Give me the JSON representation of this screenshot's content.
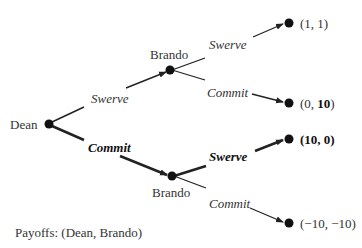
{
  "tree": {
    "root": {
      "label": "Dean"
    },
    "players": [
      "Dean",
      "Brando"
    ],
    "nodes": {
      "dean": {
        "label": "Dean"
      },
      "brando_top": {
        "label": "Brando"
      },
      "brando_bottom": {
        "label": "Brando"
      }
    },
    "edges": {
      "dean_swerve": {
        "label": "Swerve",
        "emphasis": false
      },
      "dean_commit": {
        "label": "Commit",
        "emphasis": true
      },
      "top_swerve": {
        "label": "Swerve",
        "emphasis": false
      },
      "top_commit": {
        "label": "Commit",
        "emphasis": false
      },
      "bottom_swerve": {
        "label": "Swerve",
        "emphasis": true
      },
      "bottom_commit": {
        "label": "Commit",
        "emphasis": false
      }
    },
    "payoffs": {
      "swerve_swerve": {
        "text": "(1, 1)",
        "bold": false
      },
      "swerve_commit_pre": "(0, ",
      "swerve_commit_bold": "10",
      "swerve_commit_post": ")",
      "commit_swerve": {
        "text": "(10, 0)",
        "bold": true
      },
      "commit_commit": {
        "text": "(−10, −10)",
        "bold": false
      }
    },
    "legend": "Payoffs: (Dean, Brando)"
  },
  "colors": {
    "line": "#222222",
    "text": "#333333"
  }
}
